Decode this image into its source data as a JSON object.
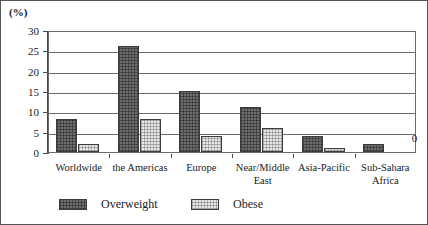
{
  "chart_data": {
    "type": "bar",
    "title": "",
    "subtitle": "",
    "xlabel": "",
    "ylabel": "(%)",
    "ylim": [
      0,
      30
    ],
    "yticks": [
      0,
      5,
      10,
      15,
      20,
      25,
      30
    ],
    "ytick_labels": [
      "0",
      "5",
      "10",
      "15",
      "20",
      "25",
      "30"
    ],
    "grid": true,
    "legend_position": "bottom",
    "categories": [
      "Worldwide",
      "the Americas",
      "Europe",
      "Near/Middle East",
      "Asia-Pacific",
      "Sub-Sahara Africa"
    ],
    "category_lines": [
      [
        "Worldwide"
      ],
      [
        "the Americas"
      ],
      [
        "Europe"
      ],
      [
        "Near/Middle",
        "East"
      ],
      [
        "Asia-Pacific"
      ],
      [
        "Sub-Sahara",
        "Africa"
      ]
    ],
    "series": [
      {
        "name": "Overweight",
        "color": "#6e6e6e",
        "pattern": "dark-hatch",
        "values": [
          8,
          26,
          15,
          11,
          4,
          2
        ]
      },
      {
        "name": "Obese",
        "color": "#e8e8e8",
        "pattern": "light-dots",
        "values": [
          2,
          8,
          4,
          6,
          1,
          0
        ]
      }
    ],
    "annotations": [
      {
        "text": "0",
        "category": "Sub-Sahara Africa",
        "series": "Obese"
      }
    ]
  },
  "legend": {
    "items": [
      {
        "label": "Overweight"
      },
      {
        "label": "Obese"
      }
    ]
  },
  "axis": {
    "unit_caption": "(%)"
  }
}
